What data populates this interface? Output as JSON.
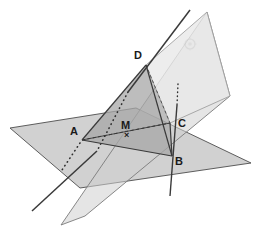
{
  "figure": {
    "background_color": "#ffffff",
    "width": 260,
    "height": 226
  },
  "palette": {
    "horizontal_plane_fill": "#c9c9c9",
    "horizontal_plane_stroke": "#4d4d4d",
    "tilted_plane_fill": "#cfcfcf",
    "tilted_plane_stroke": "#6e6e6e",
    "upper_plane_fill": "#e4e4e4",
    "upper_plane_stroke": "#9a9a9a",
    "intersection_fill": "#a8a8a8",
    "triangle_fill": "#b5b5b5",
    "solid_line": "#3a3a3a",
    "dashed_line": "#2e2e2e",
    "label_color": "#1a1a1a",
    "watermark_color": "#d5d5d5"
  },
  "labels": {
    "point_a": "A",
    "point_b": "B",
    "point_c": "C",
    "point_d": "D",
    "point_m": "M",
    "m_marker": "×"
  },
  "points": {
    "A": {
      "name": "A",
      "x": 82,
      "y": 140
    },
    "B": {
      "name": "B",
      "x": 172,
      "y": 156
    },
    "C": {
      "name": "C",
      "x": 170,
      "y": 123
    },
    "D": {
      "name": "D",
      "x": 146,
      "y": 65
    },
    "M": {
      "name": "M",
      "x": 127,
      "y": 133
    }
  },
  "label_positions": {
    "A": {
      "x": 70,
      "y": 126
    },
    "B": {
      "x": 175,
      "y": 156
    },
    "C": {
      "x": 178,
      "y": 118
    },
    "D": {
      "x": 134,
      "y": 50
    },
    "M": {
      "x": 121,
      "y": 120
    },
    "M_marker": {
      "x": 124,
      "y": 132
    }
  },
  "shapes": {
    "horizontal_plane": "10,128 136,108 251,163 80,188",
    "tilted_plane": "61,225 207,12 230,96 85,216",
    "upper_plane": "146,65 207,12 230,96 170,123",
    "intersection_region": "82,140 146,65 170,123 172,156",
    "triangle_dab": "82,140 146,65 172,156"
  },
  "lines": {
    "solid": [
      {
        "name": "edge-d-a",
        "x1": 146,
        "y1": 65,
        "x2": 82,
        "y2": 140
      },
      {
        "name": "edge-d-b",
        "x1": 146,
        "y1": 65,
        "x2": 172,
        "y2": 156
      },
      {
        "name": "edge-a-b",
        "x1": 82,
        "y1": 140,
        "x2": 172,
        "y2": 156
      },
      {
        "name": "edge-c-b",
        "x1": 170,
        "y1": 123,
        "x2": 172,
        "y2": 156
      },
      {
        "name": "edge-a-c",
        "x1": 82,
        "y1": 140,
        "x2": 170,
        "y2": 123
      },
      {
        "name": "transversal-upper",
        "x1": 190,
        "y1": 10,
        "x2": 128,
        "y2": 92
      },
      {
        "name": "transversal-lower",
        "x1": 97,
        "y1": 151,
        "x2": 32,
        "y2": 211
      },
      {
        "name": "vertical-line-upper",
        "x1": 177,
        "y1": 105,
        "x2": 173,
        "y2": 160
      },
      {
        "name": "vertical-line-lower",
        "x1": 173,
        "y1": 160,
        "x2": 170,
        "y2": 196
      }
    ],
    "dashed": [
      {
        "name": "median-a-m-c",
        "x1": 82,
        "y1": 140,
        "x2": 170,
        "y2": 123
      },
      {
        "name": "hidden-d-c",
        "x1": 146,
        "y1": 65,
        "x2": 170,
        "y2": 123
      }
    ],
    "dotted": [
      {
        "name": "hidden-transversal-in-plane",
        "x1": 128,
        "y1": 92,
        "x2": 97,
        "y2": 151
      },
      {
        "name": "hidden-segment-a-down",
        "x1": 80,
        "y1": 143,
        "x2": 62,
        "y2": 170
      },
      {
        "name": "hidden-vertical-above-c",
        "x1": 178,
        "y1": 84,
        "x2": 177,
        "y2": 105
      }
    ]
  },
  "watermark": {
    "name": "faint-circular-mark",
    "x": 190,
    "y": 44,
    "radius": 5
  }
}
